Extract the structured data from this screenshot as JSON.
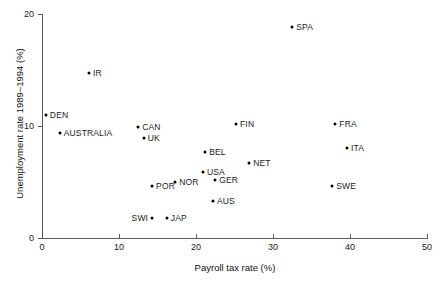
{
  "chart_data": {
    "type": "scatter",
    "title": "",
    "xlabel": "Payroll tax rate (%)",
    "ylabel": "Unemployment rate 1989–1994 (%)",
    "xlim": [
      0,
      50
    ],
    "ylim": [
      0,
      20
    ],
    "xticks": [
      0,
      10,
      20,
      30,
      40,
      50
    ],
    "yticks": [
      0,
      10,
      20
    ],
    "xtick_labels": [
      "0",
      "10",
      "20",
      "30",
      "40",
      "50"
    ],
    "ytick_labels": [
      "0",
      "10",
      "20"
    ],
    "grid": false,
    "legend": null,
    "marker": "filled-circle",
    "marker_color": "#000000",
    "points": [
      {
        "label": "DEN",
        "x": 0.5,
        "y": 11.0,
        "label_side": "right"
      },
      {
        "label": "AUSTRALIA",
        "x": 2.3,
        "y": 9.4,
        "label_side": "right"
      },
      {
        "label": "IR",
        "x": 6.1,
        "y": 14.7,
        "label_side": "right"
      },
      {
        "label": "CAN",
        "x": 12.5,
        "y": 9.9,
        "label_side": "right"
      },
      {
        "label": "UK",
        "x": 13.2,
        "y": 8.9,
        "label_side": "right"
      },
      {
        "label": "POR",
        "x": 14.3,
        "y": 4.6,
        "label_side": "right"
      },
      {
        "label": "SWI",
        "x": 14.3,
        "y": 1.8,
        "label_side": "left"
      },
      {
        "label": "JAP",
        "x": 16.2,
        "y": 1.8,
        "label_side": "right"
      },
      {
        "label": "NOR",
        "x": 17.3,
        "y": 5.0,
        "label_side": "right"
      },
      {
        "label": "BEL",
        "x": 21.2,
        "y": 7.7,
        "label_side": "right"
      },
      {
        "label": "USA",
        "x": 20.9,
        "y": 5.9,
        "label_side": "right"
      },
      {
        "label": "GER",
        "x": 22.5,
        "y": 5.2,
        "label_side": "right"
      },
      {
        "label": "AUS",
        "x": 22.2,
        "y": 3.3,
        "label_side": "right"
      },
      {
        "label": "NET",
        "x": 26.9,
        "y": 6.7,
        "label_side": "right"
      },
      {
        "label": "FIN",
        "x": 25.2,
        "y": 10.2,
        "label_side": "right"
      },
      {
        "label": "SPA",
        "x": 32.5,
        "y": 18.8,
        "label_side": "right"
      },
      {
        "label": "SWE",
        "x": 37.7,
        "y": 4.6,
        "label_side": "right"
      },
      {
        "label": "FRA",
        "x": 38.1,
        "y": 10.2,
        "label_side": "right"
      },
      {
        "label": "ITA",
        "x": 39.6,
        "y": 8.0,
        "label_side": "right"
      }
    ]
  }
}
